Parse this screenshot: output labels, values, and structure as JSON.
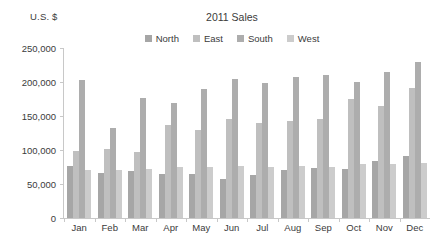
{
  "chart_data": {
    "type": "bar",
    "title": "2011 Sales",
    "xlabel": "",
    "ylabel": "U.S. $",
    "ylim": [
      0,
      250000
    ],
    "ytick_labels": [
      "250,000",
      "200,000",
      "150,000",
      "100,000",
      "50,000",
      "0"
    ],
    "ytick_values": [
      250000,
      200000,
      150000,
      100000,
      50000,
      0
    ],
    "grid": false,
    "legend_position": "top-center",
    "categories": [
      "Jan",
      "Feb",
      "Mar",
      "Apr",
      "May",
      "Jun",
      "Jul",
      "Aug",
      "Sep",
      "Oct",
      "Nov",
      "Dec"
    ],
    "series": [
      {
        "name": "North",
        "color": "#a6a6a6",
        "values": [
          77000,
          66000,
          69000,
          64000,
          65000,
          57000,
          63000,
          71000,
          73000,
          72000,
          84000,
          91000
        ]
      },
      {
        "name": "East",
        "color": "#bfbfbf",
        "values": [
          99000,
          102000,
          97000,
          137000,
          129000,
          145000,
          140000,
          143000,
          145000,
          175000,
          165000,
          191000
        ]
      },
      {
        "name": "South",
        "color": "#adadad",
        "values": [
          203000,
          133000,
          176000,
          169000,
          190000,
          205000,
          198000,
          208000,
          210000,
          200000,
          215000,
          230000
        ]
      },
      {
        "name": "West",
        "color": "#cccccc",
        "values": [
          70000,
          71000,
          72000,
          75000,
          75000,
          76000,
          75000,
          77000,
          75000,
          79000,
          80000,
          81000
        ]
      }
    ]
  },
  "colors": {
    "axis": "#c8c8c8",
    "text": "#3b3b3b",
    "background": "#ffffff"
  }
}
